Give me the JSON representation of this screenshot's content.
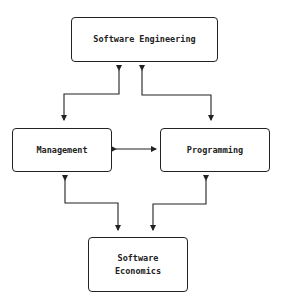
{
  "diagram": {
    "nodes": [
      {
        "id": "se",
        "label": "Software Engineering"
      },
      {
        "id": "mg",
        "label": "Management"
      },
      {
        "id": "pg",
        "label": "Programming"
      },
      {
        "id": "ec",
        "label_line1": "Software",
        "label_line2": "Economics"
      }
    ],
    "edges": [
      {
        "from": "se",
        "to": "mg",
        "bidirectional": true
      },
      {
        "from": "se",
        "to": "pg",
        "bidirectional": true
      },
      {
        "from": "mg",
        "to": "pg",
        "bidirectional": true
      },
      {
        "from": "mg",
        "to": "ec",
        "bidirectional": true
      },
      {
        "from": "pg",
        "to": "ec",
        "bidirectional": true
      }
    ],
    "colors": {
      "stroke": "#222222",
      "background": "#ffffff"
    }
  }
}
